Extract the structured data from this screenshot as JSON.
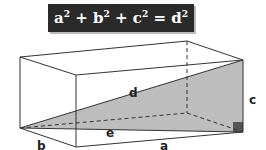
{
  "formula": {
    "a": "a",
    "b": "b",
    "c": "c",
    "d": "d",
    "exp": "2",
    "plus": "+",
    "equals": "="
  },
  "labels": {
    "a": "a",
    "b": "b",
    "c": "c",
    "d": "d",
    "e": "e"
  },
  "colors": {
    "formula_bg": "#2a2a2a",
    "formula_text": "#ffffff",
    "shading": "#bdbdbd",
    "right_angle": "#555555",
    "edges": "#333333"
  }
}
